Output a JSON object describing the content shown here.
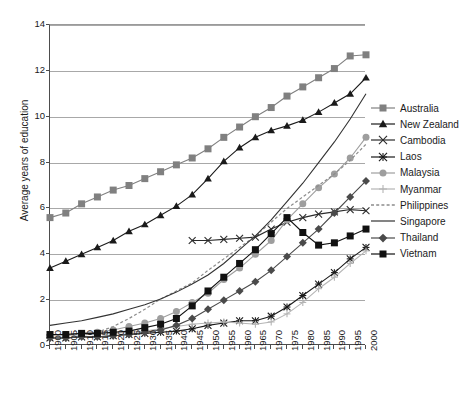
{
  "chart": {
    "type": "line",
    "title": "",
    "xlabel": "",
    "ylabel": "Average years of education",
    "xlim": [
      1900,
      2000
    ],
    "ylim": [
      0,
      14
    ],
    "ytick_step": 2,
    "xtick_step": 5,
    "grid": "horizontal",
    "legend_position": "right"
  },
  "axes": {
    "yticks": [
      "0",
      "2",
      "4",
      "6",
      "8",
      "10",
      "12",
      "14"
    ],
    "ytick_values": [
      0,
      2,
      4,
      6,
      8,
      10,
      12,
      14
    ],
    "xticks": [
      "1900",
      "1905",
      "1910",
      "1915",
      "1920",
      "1925",
      "1930",
      "1935",
      "1940",
      "1945",
      "1950",
      "1955",
      "1960",
      "1965",
      "1970",
      "1975",
      "1980",
      "1985",
      "1990",
      "1995",
      "2000"
    ],
    "xtick_values": [
      1900,
      1905,
      1910,
      1915,
      1920,
      1925,
      1930,
      1935,
      1940,
      1945,
      1950,
      1955,
      1960,
      1965,
      1970,
      1975,
      1980,
      1985,
      1990,
      1995,
      2000
    ]
  },
  "colors": {
    "australia": "#808080",
    "new_zealand": "#1a1a1a",
    "cambodia": "#2b2b2b",
    "laos": "#1a1a1a",
    "malaysia": "#9e9e9e",
    "myanmar": "#b5b5b5",
    "philippines": "#8c8c8c",
    "singapore": "#333333",
    "thailand": "#4a4a4a",
    "vietnam": "#111111",
    "grid": "#a8a8a8",
    "axis": "#4d4d4d",
    "background": "#ffffff"
  },
  "chart_data": {
    "type": "line",
    "title": "",
    "xlabel": "",
    "ylabel": "Average years of education",
    "xlim": [
      1900,
      2000
    ],
    "ylim": [
      0,
      14
    ],
    "grid": "horizontal",
    "legend_position": "right",
    "x": [
      1900,
      1905,
      1910,
      1915,
      1920,
      1925,
      1930,
      1935,
      1940,
      1945,
      1950,
      1955,
      1960,
      1965,
      1970,
      1975,
      1980,
      1985,
      1990,
      1995,
      2000
    ],
    "series": [
      {
        "name": "Australia",
        "marker": "square",
        "color": "#808080",
        "linestyle": "solid",
        "x": [
          1900,
          1905,
          1910,
          1915,
          1920,
          1925,
          1930,
          1935,
          1940,
          1945,
          1950,
          1955,
          1960,
          1965,
          1970,
          1975,
          1980,
          1985,
          1990,
          1995,
          2000
        ],
        "values": [
          5.6,
          5.8,
          6.2,
          6.5,
          6.8,
          7.0,
          7.3,
          7.6,
          7.9,
          8.2,
          8.6,
          9.1,
          9.55,
          10.0,
          10.4,
          10.9,
          11.3,
          11.7,
          12.1,
          12.65,
          12.7
        ]
      },
      {
        "name": "New Zealand",
        "marker": "triangle",
        "color": "#1a1a1a",
        "linestyle": "solid",
        "x": [
          1900,
          1905,
          1910,
          1915,
          1920,
          1925,
          1930,
          1935,
          1940,
          1945,
          1950,
          1955,
          1960,
          1965,
          1970,
          1975,
          1980,
          1985,
          1990,
          1995,
          2000
        ],
        "values": [
          3.4,
          3.7,
          4.0,
          4.3,
          4.6,
          5.0,
          5.3,
          5.7,
          6.1,
          6.6,
          7.3,
          8.05,
          8.65,
          9.1,
          9.4,
          9.6,
          9.85,
          10.2,
          10.6,
          11.0,
          11.7
        ]
      },
      {
        "name": "Cambodia",
        "marker": "x",
        "color": "#2b2b2b",
        "linestyle": "solid",
        "x": [
          1945,
          1950,
          1955,
          1960,
          1965,
          1970,
          1975,
          1980,
          1985,
          1990,
          1995,
          2000
        ],
        "values": [
          4.6,
          4.6,
          4.65,
          4.7,
          4.75,
          5.1,
          5.4,
          5.6,
          5.75,
          5.85,
          5.95,
          5.9
        ]
      },
      {
        "name": "Laos",
        "marker": "star",
        "color": "#1a1a1a",
        "linestyle": "solid",
        "x": [
          1900,
          1905,
          1910,
          1915,
          1920,
          1925,
          1930,
          1935,
          1940,
          1945,
          1950,
          1955,
          1960,
          1965,
          1970,
          1975,
          1980,
          1985,
          1990,
          1995,
          2000
        ],
        "values": [
          0.35,
          0.35,
          0.4,
          0.4,
          0.45,
          0.5,
          0.55,
          0.6,
          0.65,
          0.75,
          0.9,
          1.0,
          1.1,
          1.1,
          1.3,
          1.7,
          2.2,
          2.7,
          3.2,
          3.8,
          4.3
        ]
      },
      {
        "name": "Malaysia",
        "marker": "circle",
        "color": "#9e9e9e",
        "linestyle": "solid",
        "x": [
          1900,
          1905,
          1910,
          1915,
          1920,
          1925,
          1930,
          1935,
          1940,
          1945,
          1950,
          1955,
          1960,
          1965,
          1970,
          1975,
          1980,
          1985,
          1990,
          1995,
          2000
        ],
        "values": [
          0.45,
          0.5,
          0.55,
          0.6,
          0.7,
          0.85,
          1.0,
          1.2,
          1.5,
          1.9,
          2.3,
          2.9,
          3.4,
          4.0,
          4.6,
          5.5,
          6.2,
          6.9,
          7.5,
          8.2,
          9.1
        ]
      },
      {
        "name": "Myanmar",
        "marker": "plus",
        "color": "#b5b5b5",
        "linestyle": "solid",
        "x": [
          1900,
          1905,
          1910,
          1915,
          1920,
          1925,
          1930,
          1935,
          1940,
          1945,
          1950,
          1955,
          1960,
          1965,
          1970,
          1975,
          1980,
          1985,
          1990,
          1995,
          2000
        ],
        "values": [
          0.45,
          0.45,
          0.5,
          0.5,
          0.55,
          0.6,
          0.65,
          0.75,
          0.85,
          0.95,
          1.0,
          1.05,
          1.0,
          0.95,
          1.05,
          1.4,
          1.9,
          2.5,
          3.0,
          3.6,
          4.15
        ]
      },
      {
        "name": "Philippines",
        "marker": "none",
        "color": "#8c8c8c",
        "linestyle": "dashed",
        "x": [
          1900,
          1905,
          1910,
          1915,
          1920,
          1925,
          1930,
          1935,
          1940,
          1945,
          1950,
          1955,
          1960,
          1965,
          1970,
          1975,
          1980,
          1985,
          1990,
          1995,
          2000
        ],
        "values": [
          0.3,
          0.35,
          0.45,
          0.6,
          0.85,
          1.2,
          1.6,
          2.05,
          2.4,
          2.75,
          3.3,
          3.8,
          4.3,
          4.8,
          5.4,
          6.0,
          6.5,
          7.0,
          7.5,
          8.1,
          8.8
        ]
      },
      {
        "name": "Singapore",
        "marker": "none",
        "color": "#333333",
        "linestyle": "solid",
        "x": [
          1900,
          1905,
          1910,
          1915,
          1920,
          1925,
          1930,
          1935,
          1940,
          1945,
          1950,
          1955,
          1960,
          1965,
          1970,
          1975,
          1980,
          1985,
          1990,
          1995,
          2000
        ],
        "values": [
          0.9,
          1.0,
          1.1,
          1.25,
          1.4,
          1.6,
          1.8,
          2.05,
          2.35,
          2.7,
          3.1,
          3.6,
          4.2,
          4.8,
          5.5,
          6.3,
          7.1,
          8.0,
          8.9,
          9.9,
          11.0
        ]
      },
      {
        "name": "Thailand",
        "marker": "diamond",
        "color": "#4a4a4a",
        "linestyle": "solid",
        "x": [
          1900,
          1905,
          1910,
          1915,
          1920,
          1925,
          1930,
          1935,
          1940,
          1945,
          1950,
          1955,
          1960,
          1965,
          1970,
          1975,
          1980,
          1985,
          1990,
          1995,
          2000
        ],
        "values": [
          0.35,
          0.35,
          0.4,
          0.4,
          0.45,
          0.5,
          0.6,
          0.7,
          0.9,
          1.2,
          1.6,
          2.0,
          2.4,
          2.8,
          3.3,
          3.9,
          4.5,
          5.1,
          5.8,
          6.5,
          7.2
        ]
      },
      {
        "name": "Vietnam",
        "marker": "square",
        "color": "#111111",
        "linestyle": "solid",
        "x": [
          1900,
          1905,
          1910,
          1915,
          1920,
          1925,
          1930,
          1935,
          1940,
          1945,
          1950,
          1955,
          1960,
          1965,
          1970,
          1975,
          1980,
          1985,
          1990,
          1995,
          2000
        ],
        "values": [
          0.5,
          0.5,
          0.55,
          0.55,
          0.6,
          0.65,
          0.8,
          0.95,
          1.2,
          1.75,
          2.4,
          3.0,
          3.6,
          4.2,
          4.9,
          5.6,
          4.95,
          4.4,
          4.5,
          4.8,
          5.1
        ]
      }
    ]
  },
  "legend": {
    "items": [
      {
        "label": "Australia",
        "marker": "square",
        "color": "#808080",
        "linestyle": "solid"
      },
      {
        "label": "New Zealand",
        "marker": "triangle",
        "color": "#1a1a1a",
        "linestyle": "solid"
      },
      {
        "label": "Cambodia",
        "marker": "x",
        "color": "#2b2b2b",
        "linestyle": "solid"
      },
      {
        "label": "Laos",
        "marker": "star",
        "color": "#1a1a1a",
        "linestyle": "solid"
      },
      {
        "label": "Malaysia",
        "marker": "circle",
        "color": "#9e9e9e",
        "linestyle": "solid"
      },
      {
        "label": "Myanmar",
        "marker": "plus",
        "color": "#b5b5b5",
        "linestyle": "solid"
      },
      {
        "label": "Philippines",
        "marker": "none",
        "color": "#8c8c8c",
        "linestyle": "dashed"
      },
      {
        "label": "Singapore",
        "marker": "none",
        "color": "#333333",
        "linestyle": "solid"
      },
      {
        "label": "Thailand",
        "marker": "diamond",
        "color": "#4a4a4a",
        "linestyle": "solid"
      },
      {
        "label": "Vietnam",
        "marker": "square",
        "color": "#111111",
        "linestyle": "solid"
      }
    ]
  }
}
